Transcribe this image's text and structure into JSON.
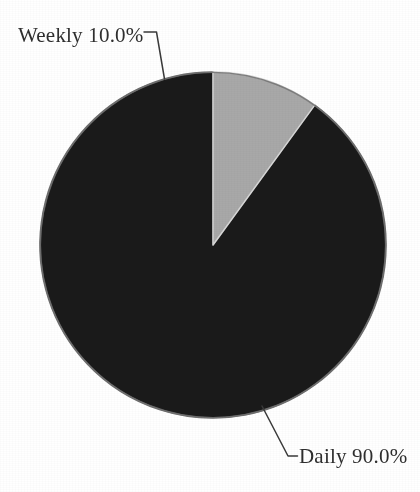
{
  "figure": {
    "background_color": "#ffffff",
    "text_color": "#2e2e2e",
    "leader_line_color": "#3a3a3a"
  },
  "pie": {
    "center_x": 213,
    "center_y": 245,
    "radius": 173,
    "start_angle_deg": 90,
    "direction": "counterclockwise",
    "rim_color": "#6e6e6e"
  },
  "labels": {
    "weekly": "Weekly 10.0%",
    "daily": "Daily 90.0%"
  },
  "icons": {
    "weekly_leader": "leader-line-icon",
    "daily_leader": "leader-line-icon"
  },
  "chart_data": {
    "type": "pie",
    "title": "",
    "subtitle": "",
    "xlabel": "",
    "ylabel": "",
    "labels": [
      "Daily",
      "Weekly"
    ],
    "values": [
      90.0,
      10.0
    ],
    "value_unit": "%",
    "display_labels": [
      "Daily 90.0%",
      "Weekly 10.0%"
    ],
    "colors": [
      "#1a1a1a",
      "#a8a8a8"
    ],
    "slices": [
      {
        "name": "Daily",
        "value": 90.0,
        "percent": 90.0,
        "display_label": "Daily 90.0%",
        "color": "#1a1a1a",
        "start_angle_deg": 90,
        "sweep_deg": 324,
        "label_position": "outside-bottom-right"
      },
      {
        "name": "Weekly",
        "value": 10.0,
        "percent": 10.0,
        "display_label": "Weekly 10.0%",
        "color": "#a8a8a8",
        "start_angle_deg": 54,
        "sweep_deg": 36,
        "label_position": "outside-top-left"
      }
    ],
    "legend": {
      "visible": false,
      "position": "none",
      "entries": []
    },
    "grid": false,
    "startangle": 90,
    "counterclock": true,
    "autopct": "%.1f%%",
    "labeldistance": 1.25
  }
}
